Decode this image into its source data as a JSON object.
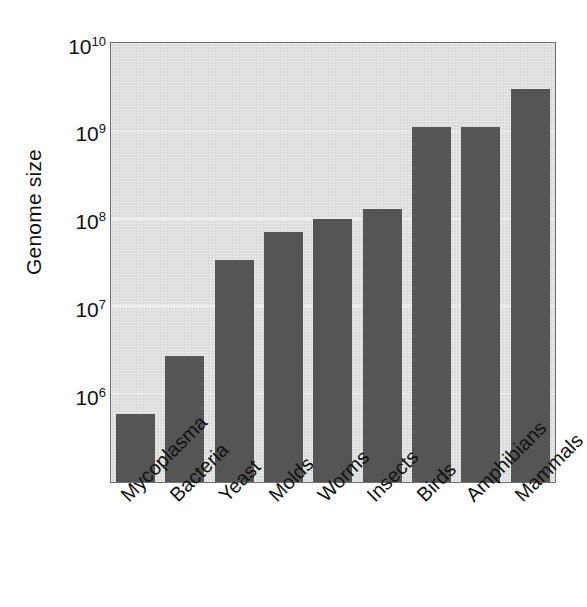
{
  "chart_data": {
    "type": "bar",
    "title": "",
    "xlabel": "",
    "ylabel": "Genome size",
    "scale": "log",
    "grid": true,
    "legend": "none",
    "ylim": [
      100000,
      10000000000
    ],
    "ytick_values": [
      1000000,
      10000000,
      100000000,
      1000000000,
      10000000000
    ],
    "ytick_labels": [
      {
        "mantissa": "10",
        "exponent": "6"
      },
      {
        "mantissa": "10",
        "exponent": "7"
      },
      {
        "mantissa": "10",
        "exponent": "8"
      },
      {
        "mantissa": "10",
        "exponent": "9"
      },
      {
        "mantissa": "10",
        "exponent": "10"
      }
    ],
    "categories": [
      "Mycoplasma",
      "Bacteria",
      "Yeast",
      "Molds",
      "Worms",
      "Insects",
      "Birds",
      "Amphibians",
      "Mammals"
    ],
    "values": [
      600000,
      2700000,
      34000000,
      70000000,
      100000000,
      130000000,
      1100000000,
      1100000000,
      3000000000
    ],
    "bar_color": "#555555",
    "plot_background": "#d9d9d9",
    "gridline_color": "#ececec",
    "axis_color": "#6f6f6f",
    "page_background": "#ffffff"
  }
}
